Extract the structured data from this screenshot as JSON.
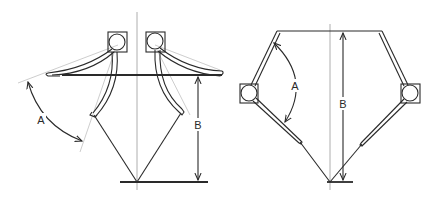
{
  "diagram": {
    "left_figure": {
      "name": "open-position",
      "labels": {
        "angle": "A",
        "height": "B"
      }
    },
    "right_figure": {
      "name": "closed-position",
      "labels": {
        "angle": "A",
        "height": "B"
      }
    },
    "colors": {
      "line": "#2a2a2a",
      "construction": "#b8b8b8",
      "background": "#ffffff"
    }
  }
}
